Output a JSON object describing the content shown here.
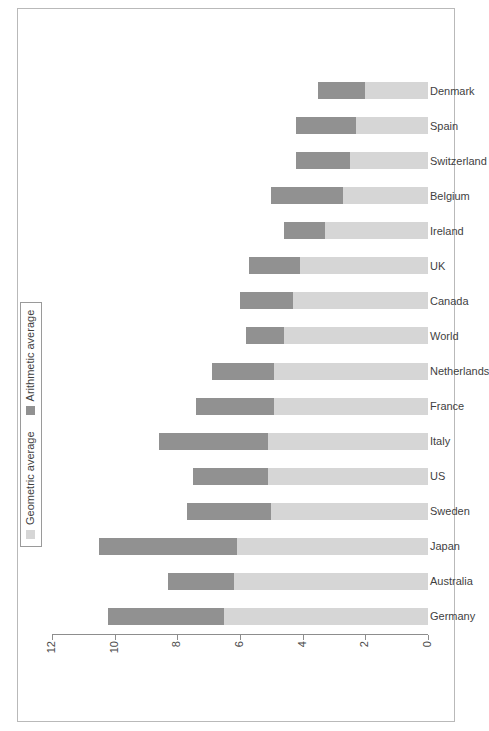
{
  "margin_note": "",
  "legend": {
    "items": [
      {
        "label": "Geometric average",
        "key": "geometric",
        "color": "#d6d6d6",
        "swatch": "square-swatch-icon"
      },
      {
        "label": "Arithmetic average",
        "key": "arithmetic",
        "color": "#919191",
        "swatch": "square-swatch-icon"
      }
    ]
  },
  "axis": {
    "ticks": [
      "0",
      "2",
      "4",
      "6",
      "8",
      "10",
      "12"
    ],
    "min": 0,
    "max": 12
  },
  "chart_data": {
    "type": "bar",
    "subtype": "stacked-bar",
    "title": "",
    "subtitle": "",
    "xlabel": "",
    "ylabel": "",
    "ylim": [
      0,
      12
    ],
    "yticks": [
      0,
      2,
      4,
      6,
      8,
      10,
      12
    ],
    "grid": false,
    "legend_position": "top-left",
    "orientation": "vertical",
    "page_rotation_degrees": -90,
    "categories": [
      "Germany",
      "Australia",
      "Japan",
      "Sweden",
      "US",
      "Italy",
      "France",
      "Netherlands",
      "World",
      "Canada",
      "UK",
      "Ireland",
      "Belgium",
      "Switzerland",
      "Spain",
      "Denmark"
    ],
    "series": [
      {
        "name": "Geometric average",
        "color": "#d6d6d6",
        "stack_order": 0,
        "values": [
          6.5,
          6.2,
          6.1,
          5.0,
          5.1,
          5.1,
          4.9,
          4.9,
          4.6,
          4.3,
          4.1,
          3.3,
          2.7,
          2.5,
          2.3,
          2.0
        ]
      },
      {
        "name": "Arithmetic average",
        "color": "#919191",
        "stack_order": 1,
        "values": [
          3.7,
          2.1,
          4.4,
          2.7,
          2.4,
          3.5,
          2.5,
          2.0,
          1.2,
          1.7,
          1.6,
          1.3,
          2.3,
          1.7,
          1.9,
          1.5
        ]
      }
    ],
    "totals": [
      10.2,
      8.3,
      10.5,
      7.7,
      7.5,
      8.6,
      7.4,
      6.9,
      5.8,
      6.0,
      5.7,
      4.6,
      5.0,
      4.2,
      4.2,
      3.5
    ]
  }
}
